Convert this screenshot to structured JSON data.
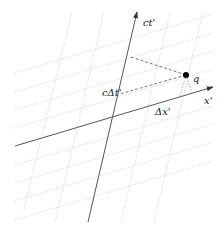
{
  "diagram": {
    "type": "spacetime-diagram",
    "colors": {
      "background": "#ffffff",
      "axis": "#555555",
      "grid": "#c8c8c8",
      "dashed": "#555555",
      "point": "#000000",
      "text": "#222222"
    },
    "axes": {
      "time": {
        "label": "ct'",
        "from": [
          88,
          222
        ],
        "to": [
          137,
          12
        ]
      },
      "space": {
        "label": "x'",
        "from": [
          15,
          146
        ],
        "to": [
          213,
          87
        ]
      }
    },
    "point": {
      "label": "q",
      "x": 186,
      "y": 75
    },
    "projections": {
      "time_interval_label": "cΔt'",
      "space_interval_label": "Δx'"
    },
    "labels": {
      "ct_axis": "ct'",
      "x_axis": "x'",
      "point_q": "q",
      "c_delta_t": "cΔt'",
      "delta_x": "Δx'"
    }
  }
}
